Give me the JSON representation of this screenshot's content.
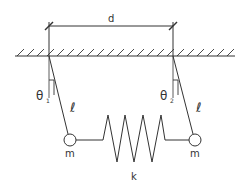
{
  "diagram": {
    "type": "coupled-pendulums",
    "labels": {
      "distance": "d",
      "angle_left": "θ",
      "angle_left_sub": "1",
      "angle_right": "θ",
      "angle_right_sub": "2",
      "length_left": "ℓ",
      "length_right": "ℓ",
      "mass_left": "m",
      "mass_right": "m",
      "spring": "k"
    },
    "colors": {
      "line": "#333333",
      "background": "#ffffff"
    }
  }
}
